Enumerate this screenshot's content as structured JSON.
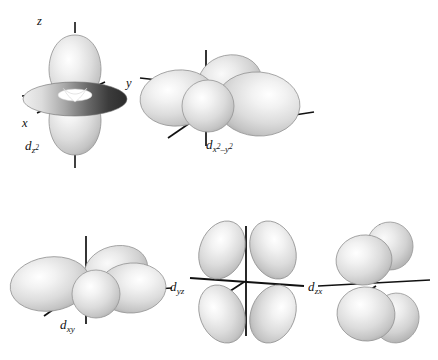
{
  "figure": {
    "background_color": "#ffffff",
    "width": 438,
    "height": 360
  },
  "palette": {
    "lobe_fill_light": "#f4f4f4",
    "lobe_fill_mid": "#d5d5d5",
    "lobe_fill_edge": "#a9a9a9",
    "lobe_outline": "#8c8c8c",
    "torus_dark": "#3a3a3a",
    "torus_light": "#e2e2e2",
    "axis_line": "#111111",
    "text": "#111111"
  },
  "orbitals": [
    {
      "id": "dz2",
      "name": "d z squared orbital",
      "label_d": "d",
      "label_sub": "z",
      "label_sup": "2",
      "axes": [
        {
          "name": "z",
          "label": "z"
        },
        {
          "name": "y",
          "label": "y"
        },
        {
          "name": "x",
          "label": "x"
        }
      ]
    },
    {
      "id": "dx2y2",
      "name": "d x squared minus y squared orbital",
      "label_d": "d",
      "label_sub_1": "x",
      "label_sup_1": "2",
      "label_minus": "–",
      "label_sub_2": "y",
      "label_sup_2": "2",
      "axes": []
    },
    {
      "id": "dxy",
      "name": "d xy orbital",
      "label_d": "d",
      "label_sub": "xy",
      "axes": []
    },
    {
      "id": "dyz",
      "name": "d yz orbital",
      "label_d": "d",
      "label_sub": "yz",
      "axes": []
    },
    {
      "id": "dzx",
      "name": "d zx orbital",
      "label_d": "d",
      "label_sub": "zx",
      "axes": []
    }
  ]
}
